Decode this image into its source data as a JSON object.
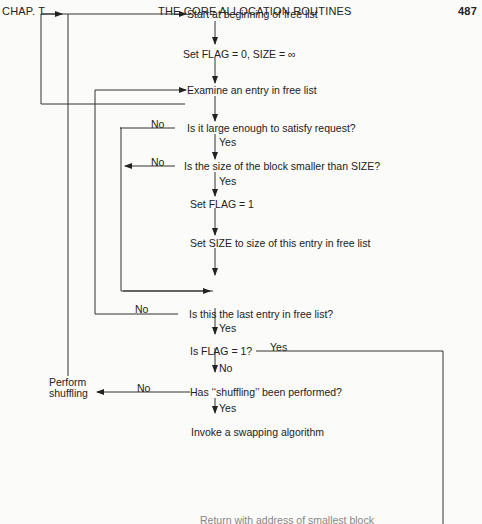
{
  "header": {
    "chapter": "CHAP. T",
    "title": "THE CORE ALLOCATION ROUTINES",
    "page_number": "487"
  },
  "flowchart": {
    "nodes": {
      "start": "Start at beginning of free list",
      "init": "Set FLAG = 0, SIZE = ∞",
      "examine": "Examine an entry in free list",
      "large_enough": "Is it large enough to satisfy request?",
      "smaller": "Is the size of the block smaller than SIZE?",
      "set_flag": "Set FLAG = 1",
      "set_size": "Set SIZE to size of this entry in free list",
      "last_entry": "Is this the last entry in free list?",
      "flag_check": "Is FLAG = 1?",
      "shuffled": "Has ‘‘shuffling’’ been performed?",
      "swap": "Invoke a swapping algorithm",
      "perform_shuffling_line1": "Perform",
      "perform_shuffling_line2": "shuffling",
      "return": "Return with address of smallest block"
    },
    "labels": {
      "no1": "No",
      "yes1": "Yes",
      "no2": "No",
      "yes2": "Yes",
      "no3": "No",
      "yes3": "Yes",
      "yes_flag": "Yes",
      "no_flag": "No",
      "no_shuffle": "No",
      "yes_shuffle": "Yes"
    }
  }
}
